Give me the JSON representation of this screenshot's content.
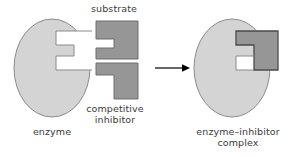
{
  "figure": {
    "background_color": "#ffffff",
    "width": 293,
    "height": 157
  },
  "colors": {
    "enzyme_fill": "#d4d4d4",
    "enzyme_stroke": "#8a8a8a",
    "substrate_fill": "#969696",
    "substrate_stroke": "#6e6e6e",
    "inhibitor_fill": "#969696",
    "inhibitor_stroke": "#6e6e6e",
    "bound_inhibitor_fill": "#969696",
    "bound_inhibitor_stroke": "#4a4a4a",
    "gap_fill": "#ffffff",
    "arrow_color": "#000000",
    "text_color": "#3a3a3a"
  },
  "labels": {
    "substrate": "substrate",
    "competitive_inhibitor": "competitive\ninhibitor",
    "enzyme": "enzyme",
    "enzyme_inhibitor_complex": "enzyme–inhibitor\ncomplex"
  },
  "shapes": {
    "enzyme_left": {
      "name": "enzyme",
      "type": "ellipse-with-stepped-notch",
      "center_x": 52,
      "center_y": 68,
      "radius_x": 38,
      "radius_y": 49
    },
    "substrate": {
      "name": "substrate",
      "type": "rectangle-with-left-notch",
      "x": 96,
      "y": 21,
      "width": 42,
      "height": 38
    },
    "competitive_inhibitor": {
      "name": "competitive-inhibitor",
      "type": "L-shape",
      "x": 96,
      "y": 63,
      "width": 42,
      "height": 36
    },
    "arrow": {
      "name": "reaction-arrow",
      "x1": 155,
      "x2": 187,
      "y": 68,
      "direction": "right"
    },
    "enzyme_right": {
      "name": "enzyme-inhibitor-complex",
      "type": "ellipse-with-bound-inhibitor",
      "center_x": 232,
      "center_y": 68,
      "radius_x": 38,
      "radius_y": 49
    }
  },
  "icons": {
    "arrow": "arrow-right-icon"
  }
}
